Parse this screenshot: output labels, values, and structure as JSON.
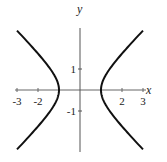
{
  "chart_data": {
    "type": "line",
    "title": "",
    "equation": "x^2 - y^2 = 1",
    "xlabel": "x",
    "ylabel": "y",
    "xlim": [
      -3,
      3
    ],
    "ylim": [
      -2.83,
      2.83
    ],
    "grid": false,
    "legend": null,
    "x_ticks": [
      -3,
      -2,
      2,
      3
    ],
    "x_tick_labels": [
      "-3",
      "-2",
      "2",
      "3"
    ],
    "y_ticks": [
      1,
      -1
    ],
    "y_tick_labels": [
      "1",
      "-1"
    ],
    "series": [
      {
        "name": "right branch",
        "x": [
          3,
          2.5,
          2,
          1.5,
          1.2,
          1,
          1.2,
          1.5,
          2,
          2.5,
          3
        ],
        "y": [
          2.83,
          2.29,
          1.73,
          1.12,
          0.66,
          0,
          -0.66,
          -1.12,
          -1.73,
          -2.29,
          -2.83
        ]
      },
      {
        "name": "left branch",
        "x": [
          -3,
          -2.5,
          -2,
          -1.5,
          -1.2,
          -1,
          -1.2,
          -1.5,
          -2,
          -2.5,
          -3
        ],
        "y": [
          2.83,
          2.29,
          1.73,
          1.12,
          0.66,
          0,
          -0.66,
          -1.12,
          -1.73,
          -2.29,
          -2.83
        ]
      }
    ],
    "colors": {
      "curve": "#111111",
      "axis": "#555555"
    }
  }
}
